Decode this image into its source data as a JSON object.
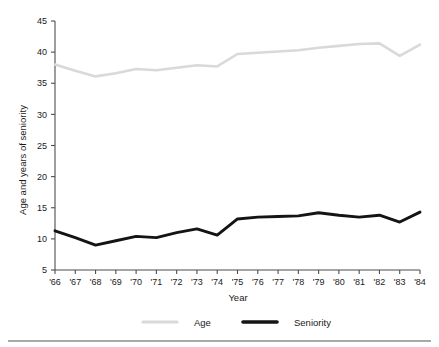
{
  "chart_data": {
    "type": "line",
    "title": "",
    "xlabel": "Year",
    "ylabel": "Age and years of seniority",
    "categories": [
      "'66",
      "'67",
      "'68",
      "'69",
      "'70",
      "'71",
      "'72",
      "'73",
      "'74",
      "'75",
      "'76",
      "'77",
      "'78",
      "'79",
      "'80",
      "'81",
      "'82",
      "'83",
      "'84"
    ],
    "x_tick_labels": [
      "'66",
      "'67",
      "'68",
      "'69",
      "'70",
      "'71",
      "'72",
      "'73",
      "'74",
      "'75",
      "'76",
      "'77",
      "'78",
      "'79",
      "'80",
      "'81",
      "'82",
      "'83",
      "'84"
    ],
    "y_tick_labels": [
      "5",
      "10",
      "15",
      "20",
      "25",
      "30",
      "35",
      "40",
      "45"
    ],
    "y_ticks": [
      5,
      10,
      15,
      20,
      25,
      30,
      35,
      40,
      45
    ],
    "ylim": [
      5,
      45
    ],
    "grid": false,
    "legend_position": "bottom",
    "series": [
      {
        "name": "Age",
        "color": "#d9d9d9",
        "values": [
          38.0,
          37.0,
          36.1,
          36.6,
          37.3,
          37.1,
          37.5,
          37.9,
          37.7,
          39.7,
          39.9,
          40.1,
          40.3,
          40.7,
          41.0,
          41.3,
          41.4,
          39.4,
          41.2
        ]
      },
      {
        "name": "Seniority",
        "color": "#141414",
        "values": [
          11.3,
          10.2,
          9.0,
          9.7,
          10.4,
          10.2,
          11.0,
          11.6,
          10.6,
          13.2,
          13.5,
          13.6,
          13.7,
          14.2,
          13.8,
          13.5,
          13.8,
          12.7,
          14.3
        ]
      }
    ]
  },
  "legend": {
    "items": [
      {
        "label": "Age",
        "color": "#d9d9d9",
        "width": 3.2
      },
      {
        "label": "Seniority",
        "color": "#141414",
        "width": 3.6
      }
    ]
  },
  "axis": {
    "x_title": "Year",
    "y_title": "Age and years of seniority"
  }
}
